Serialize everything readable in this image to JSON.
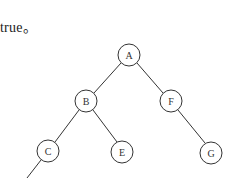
{
  "caption": {
    "text": "true。"
  },
  "tree": {
    "nodes": [
      {
        "id": "A",
        "label": "A",
        "x": 129,
        "y": 55
      },
      {
        "id": "B",
        "label": "B",
        "x": 86,
        "y": 101
      },
      {
        "id": "F",
        "label": "F",
        "x": 171,
        "y": 101
      },
      {
        "id": "C",
        "label": "C",
        "x": 48,
        "y": 151
      },
      {
        "id": "E",
        "label": "E",
        "x": 122,
        "y": 152
      },
      {
        "id": "G",
        "label": "G",
        "x": 211,
        "y": 153
      }
    ],
    "edges": [
      {
        "from": "A",
        "to": "B"
      },
      {
        "from": "A",
        "to": "F"
      },
      {
        "from": "B",
        "to": "C"
      },
      {
        "from": "B",
        "to": "E"
      },
      {
        "from": "F",
        "to": "G"
      },
      {
        "from": "C",
        "to": "(offscreen)"
      }
    ]
  }
}
